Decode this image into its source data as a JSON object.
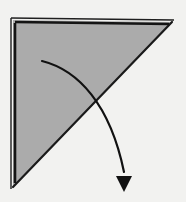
{
  "figure": {
    "title": "Paper folding step diagram",
    "caption": "Triangular folded sheet with curved motion arrow",
    "background_color": "#f2f2f0"
  },
  "shape": {
    "name": "right-triangle",
    "label": "Folded paper triangle",
    "fill_color": "#ababab",
    "stroke_color": "#1a1a1a",
    "vertices": {
      "top_left": [
        13,
        20
      ],
      "top_right": [
        172,
        22
      ],
      "bottom_left": [
        13,
        187
      ]
    },
    "points": "13,20 172,22 13,187",
    "right_angle_at": "top-left"
  },
  "edges": {
    "top_outer": {
      "name": "top-outer-edge",
      "points": "11,18 174,20",
      "stroke_width": 1.4,
      "color": "#1f1f1f"
    },
    "top_inner": {
      "name": "top-inner-edge",
      "points": "15,22 169,24",
      "stroke_width": 2.6,
      "color": "#141414"
    },
    "left_outer": {
      "name": "left-outer-edge",
      "points": "11,18 11,189",
      "stroke_width": 1.4,
      "color": "#1f1f1f"
    },
    "left_inner": {
      "name": "left-inner-edge",
      "points": "15,23 15,183",
      "stroke_width": 2.6,
      "color": "#141414"
    },
    "hypotenuse": {
      "name": "hypotenuse-fold-line",
      "points": "172,22 13,187",
      "stroke_width": 2.2,
      "color": "#1a1a1a"
    }
  },
  "arrow": {
    "name": "fold-motion-arrow",
    "label": "Fold direction",
    "color": "#111111",
    "stroke_width": 2.2,
    "path": "M 42,61 C 78,70 110,104 124,172",
    "start_point": [
      42,
      61
    ],
    "end_point": [
      124,
      178
    ],
    "head": {
      "name": "arrowhead",
      "points": "124,192 116,176 132,176",
      "direction": "down"
    }
  }
}
